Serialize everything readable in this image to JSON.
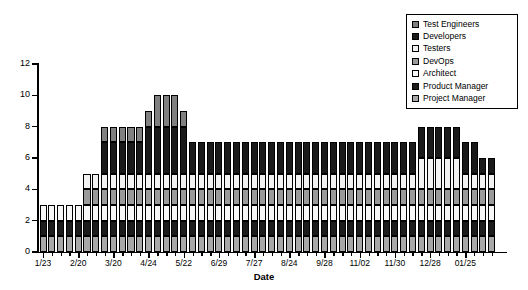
{
  "chart_data": {
    "type": "bar",
    "title": "",
    "subtitle": "",
    "xlabel": "Date",
    "ylabel": "Staffing",
    "ylim": [
      0,
      12
    ],
    "yticks": [
      0,
      2,
      4,
      6,
      8,
      10,
      12
    ],
    "grid": false,
    "stacked": true,
    "legend_position": "top-right",
    "xtick_labels": [
      "1/23",
      "2/20",
      "3/20",
      "4/24",
      "5/22",
      "6/29",
      "7/27",
      "8/24",
      "9/28",
      "11/02",
      "11/30",
      "12/28",
      "01/25"
    ],
    "xtick_indices": [
      0,
      4,
      8,
      12,
      16,
      20,
      24,
      28,
      32,
      36,
      40,
      44,
      48
    ],
    "categories": [
      "1/23",
      "1/30",
      "2/06",
      "2/13",
      "2/20",
      "2/27",
      "3/06",
      "3/13",
      "3/20",
      "3/27",
      "4/03",
      "4/10",
      "4/17",
      "4/24",
      "5/01",
      "5/08",
      "5/15",
      "5/22",
      "5/29",
      "6/05",
      "6/12",
      "6/19",
      "6/29",
      "7/06",
      "7/13",
      "7/20",
      "7/27",
      "8/03",
      "8/10",
      "8/17",
      "8/24",
      "8/31",
      "9/07",
      "9/14",
      "9/21",
      "9/28",
      "10/12",
      "10/19",
      "10/26",
      "11/02",
      "11/09",
      "11/16",
      "11/23",
      "11/30",
      "12/07",
      "12/14",
      "12/21",
      "12/28",
      "01/04",
      "01/11",
      "01/18",
      "01/25"
    ],
    "totals": [
      3,
      3,
      3,
      3,
      3,
      5,
      5,
      8,
      8,
      8,
      8,
      8,
      9,
      10,
      10,
      10,
      9,
      8,
      8,
      8,
      8,
      8,
      7,
      7,
      7,
      7,
      7,
      7,
      7,
      7,
      7,
      7,
      7,
      7,
      7,
      7,
      7,
      7,
      7,
      7,
      7,
      7,
      7,
      8,
      8,
      8,
      8,
      8,
      7,
      7,
      6,
      6
    ],
    "series": [
      {
        "name": "Project Manager",
        "color": "#a8a8a8",
        "values": [
          1,
          1,
          1,
          1,
          1,
          1,
          1,
          1,
          1,
          1,
          1,
          1,
          1,
          1,
          1,
          1,
          1,
          1,
          1,
          1,
          1,
          1,
          1,
          1,
          1,
          1,
          1,
          1,
          1,
          1,
          1,
          1,
          1,
          1,
          1,
          1,
          1,
          1,
          1,
          1,
          1,
          1,
          1,
          1,
          1,
          1,
          1,
          1,
          1,
          1,
          1,
          1
        ]
      },
      {
        "name": "Product Manager",
        "color": "#1c1c1c",
        "values": [
          1,
          1,
          1,
          1,
          1,
          1,
          1,
          1,
          1,
          1,
          1,
          1,
          1,
          1,
          1,
          1,
          1,
          1,
          1,
          1,
          1,
          1,
          1,
          1,
          1,
          1,
          1,
          1,
          1,
          1,
          1,
          1,
          1,
          1,
          1,
          1,
          1,
          1,
          1,
          1,
          1,
          1,
          1,
          1,
          1,
          1,
          1,
          1,
          1,
          1,
          1,
          1
        ]
      },
      {
        "name": "Architect",
        "color": "#f7f7f7",
        "values": [
          1,
          1,
          1,
          1,
          1,
          1,
          1,
          1,
          1,
          1,
          1,
          1,
          1,
          1,
          1,
          1,
          1,
          1,
          1,
          1,
          1,
          1,
          1,
          1,
          1,
          1,
          1,
          1,
          1,
          1,
          1,
          1,
          1,
          1,
          1,
          1,
          1,
          1,
          1,
          1,
          1,
          1,
          1,
          1,
          1,
          1,
          1,
          1,
          1,
          1,
          1,
          1
        ]
      },
      {
        "name": "DevOps",
        "color": "#9a9a9a",
        "values": [
          0,
          0,
          0,
          0,
          0,
          1,
          1,
          1,
          1,
          1,
          1,
          1,
          1,
          1,
          1,
          1,
          1,
          1,
          1,
          1,
          1,
          1,
          1,
          1,
          1,
          1,
          1,
          1,
          1,
          1,
          1,
          1,
          1,
          1,
          1,
          1,
          1,
          1,
          1,
          1,
          1,
          1,
          1,
          1,
          1,
          1,
          1,
          1,
          1,
          1,
          1,
          1
        ]
      },
      {
        "name": "Testers",
        "color": "#f2f2f2",
        "values": [
          0,
          0,
          0,
          0,
          0,
          1,
          1,
          1,
          1,
          1,
          1,
          1,
          1,
          1,
          1,
          1,
          1,
          1,
          1,
          1,
          1,
          1,
          1,
          1,
          1,
          1,
          1,
          1,
          1,
          1,
          1,
          1,
          1,
          1,
          1,
          1,
          1,
          1,
          1,
          1,
          1,
          1,
          1,
          2,
          2,
          2,
          2,
          2,
          1,
          1,
          1,
          1
        ]
      },
      {
        "name": "Developers",
        "color": "#1a1a1a",
        "values": [
          0,
          0,
          0,
          0,
          0,
          0,
          0,
          2,
          2,
          2,
          2,
          2,
          3,
          3,
          3,
          3,
          3,
          2,
          2,
          2,
          2,
          2,
          2,
          2,
          2,
          2,
          2,
          2,
          2,
          2,
          2,
          2,
          2,
          2,
          2,
          2,
          2,
          2,
          2,
          2,
          2,
          2,
          2,
          2,
          2,
          2,
          2,
          2,
          2,
          2,
          1,
          1
        ]
      },
      {
        "name": "Test Engineers",
        "color": "#808080",
        "values": [
          0,
          0,
          0,
          0,
          0,
          0,
          0,
          1,
          1,
          1,
          1,
          1,
          1,
          2,
          2,
          2,
          1,
          0,
          0,
          0,
          0,
          0,
          0,
          0,
          0,
          0,
          0,
          0,
          0,
          0,
          0,
          0,
          0,
          0,
          0,
          0,
          0,
          0,
          0,
          0,
          0,
          0,
          0,
          0,
          0,
          0,
          0,
          0,
          0,
          0,
          0,
          0
        ]
      }
    ],
    "legend_order": [
      "Test Engineers",
      "Developers",
      "Testers",
      "DevOps",
      "Architect",
      "Product Manager",
      "Project Manager"
    ]
  },
  "legend": {
    "items": [
      {
        "label": "Test Engineers",
        "swatch": "#808080"
      },
      {
        "label": "Developers",
        "swatch": "#1a1a1a"
      },
      {
        "label": "Testers",
        "swatch": "#f2f2f2"
      },
      {
        "label": "DevOps",
        "swatch": "#9a9a9a"
      },
      {
        "label": "Architect",
        "swatch": "#f7f7f7"
      },
      {
        "label": "Product Manager",
        "swatch": "#1c1c1c"
      },
      {
        "label": "Project Manager",
        "swatch": "#a8a8a8"
      }
    ]
  }
}
